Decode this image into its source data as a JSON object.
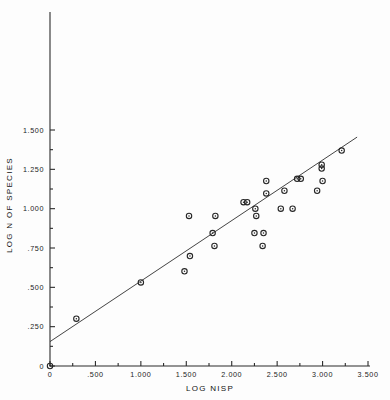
{
  "chart_data": {
    "type": "scatter",
    "title": "",
    "xlabel": "LOG NISP",
    "ylabel": "LOG N OF SPECIES",
    "xlim": [
      0,
      3.5
    ],
    "ylim": [
      0,
      1.5
    ],
    "grid": false,
    "legend": null,
    "x_ticks": [
      0,
      0.5,
      1.0,
      1.5,
      2.0,
      2.5,
      3.0,
      3.5
    ],
    "x_tick_labels": [
      "0",
      ".500",
      "1.000",
      "1.500",
      "2.000",
      "2.500",
      "3.000",
      "3.500"
    ],
    "x_minor_ticks": [
      0.25,
      0.75,
      1.25,
      1.75,
      2.25,
      2.75,
      3.25
    ],
    "y_ticks": [
      0,
      0.25,
      0.5,
      0.75,
      1.0,
      1.25,
      1.5
    ],
    "y_tick_labels": [
      "0",
      ".250",
      ".500",
      ".750",
      "1.000",
      "1.250",
      "1.500"
    ],
    "y_minor_ticks": [
      0.125,
      0.375,
      0.625,
      0.875,
      1.125,
      1.375
    ],
    "series": [
      {
        "name": "sites",
        "marker": "circle-open",
        "color": "#262626",
        "points": [
          [
            0.0,
            0.0
          ],
          [
            0.29,
            0.301
          ],
          [
            1.0,
            0.531
          ],
          [
            1.48,
            0.602
          ],
          [
            1.53,
            0.954
          ],
          [
            1.54,
            0.699
          ],
          [
            1.79,
            0.845
          ],
          [
            1.81,
            0.763
          ],
          [
            1.82,
            0.954
          ],
          [
            2.13,
            1.041
          ],
          [
            2.17,
            1.041
          ],
          [
            2.25,
            0.845
          ],
          [
            2.26,
            1.0
          ],
          [
            2.27,
            0.954
          ],
          [
            2.35,
            0.845
          ],
          [
            2.34,
            0.763
          ],
          [
            2.38,
            1.097
          ],
          [
            2.38,
            1.176
          ],
          [
            2.54,
            1.0
          ],
          [
            2.58,
            1.114
          ],
          [
            2.67,
            1.0
          ],
          [
            2.72,
            1.19
          ],
          [
            2.76,
            1.19
          ],
          [
            2.94,
            1.114
          ],
          [
            2.99,
            1.279
          ],
          [
            2.99,
            1.255
          ],
          [
            3.0,
            1.176
          ],
          [
            3.21,
            1.369
          ]
        ]
      }
    ],
    "fit_line": {
      "type": "linear-regression",
      "x_start": 0.0,
      "y_start": 0.155,
      "x_end": 3.38,
      "y_end": 1.455
    }
  },
  "axes": {
    "origin_px": {
      "x": 50,
      "y": 366
    },
    "x_unit_px": 90.86,
    "y_unit_px": 157.33
  }
}
